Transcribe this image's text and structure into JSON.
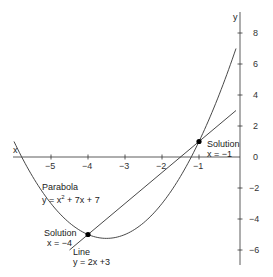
{
  "chart_data": {
    "type": "line",
    "title": "",
    "xlabel": "x",
    "ylabel": "y",
    "xlim": [
      -6,
      0
    ],
    "ylim": [
      -7,
      9
    ],
    "x_ticks": [
      -5,
      -4,
      -3,
      -2,
      -1
    ],
    "x_tick_labels": [
      "−5",
      "−4",
      "−3",
      "−2",
      "−1"
    ],
    "y_ticks": [
      8,
      6,
      4,
      2,
      0,
      -2,
      -4,
      -6
    ],
    "y_tick_labels": [
      "8",
      "6",
      "4",
      "2",
      "0",
      "−2",
      "−4",
      "−6"
    ],
    "grid": false,
    "series": [
      {
        "name": "Parabola",
        "equation": "y = x² + 7x + 7",
        "x": [
          -6,
          -5.5,
          -5,
          -4.5,
          -4,
          -3.5,
          -3,
          -2.5,
          -2,
          -1.5,
          -1,
          -0.5,
          0
        ],
        "values": [
          1,
          -1.25,
          -3,
          -4.25,
          -5,
          -5.25,
          -5,
          -4.25,
          -3,
          -1.25,
          1,
          3.25,
          7
        ]
      },
      {
        "name": "Line",
        "equation": "y = 2x +3",
        "x": [
          -4.5,
          -4,
          -3,
          -2,
          -1,
          0
        ],
        "values": [
          -6,
          -5,
          -3,
          -1,
          1,
          3
        ]
      }
    ],
    "annotations": [
      {
        "text": "Solution x = −4",
        "point": [
          -4,
          -5
        ]
      },
      {
        "text": "Solution x = −1",
        "point": [
          -1,
          1
        ]
      }
    ]
  },
  "labels": {
    "x_axis": "x",
    "y_axis": "y",
    "parabola_name": "Parabola",
    "parabola_eq": "y = x² + 7x + 7",
    "line_name": "Line",
    "line_eq": "y = 2x +3",
    "solution_left_title": "Solution",
    "solution_left_value": "x = −4",
    "solution_right_title": "Solution",
    "solution_right_value": "x = −1"
  },
  "style": {
    "line_color": "#333333",
    "point_color": "#000000"
  }
}
